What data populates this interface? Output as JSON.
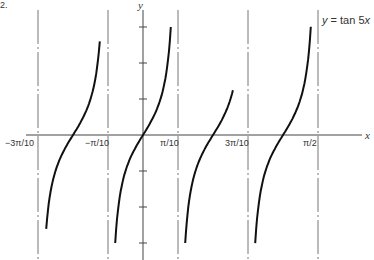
{
  "figure_number": "2.",
  "chart_data": {
    "type": "line",
    "title": "y = tan 5x",
    "function": "tan(5x)",
    "xlabel": "x",
    "ylabel": "y",
    "x_tick_labels": [
      "−3π/10",
      "−π/10",
      "π/10",
      "3π/10",
      "π/2"
    ],
    "x_tick_values": [
      -0.9425,
      -0.3142,
      0.3142,
      0.9425,
      1.5708
    ],
    "vertical_asymptotes": [
      "−3π/10",
      "−π/10",
      "π/10",
      "3π/10",
      "π/2"
    ],
    "zero_crossings": [
      "−π/5",
      "0",
      "π/5",
      "2π/5"
    ],
    "y_ticks": [
      -3,
      -2,
      -1,
      1,
      2,
      3
    ],
    "ylim": [
      -3.1,
      3.5
    ],
    "xlim": [
      -0.45,
      0.73
    ],
    "branches": [
      {
        "center": "−π/5",
        "x_range": [
          -0.8692,
          -0.3875
        ]
      },
      {
        "center": "0",
        "x_range": [
          -0.2498,
          0.2498
        ]
      },
      {
        "center": "π/5",
        "x_range": [
          0.3785,
          0.8068
        ]
      },
      {
        "center": "2π/5",
        "x_range": [
          1.0068,
          1.5066
        ]
      }
    ],
    "grid": false,
    "legend": null
  },
  "labels": {
    "x_axis": "x",
    "y_axis": "y",
    "equation_prefix": "y",
    "equation_body": " = tan 5",
    "equation_var": "x",
    "ticks": [
      "−3π/10",
      "−π/10",
      "π/10",
      "3π/10",
      "π/2"
    ]
  }
}
